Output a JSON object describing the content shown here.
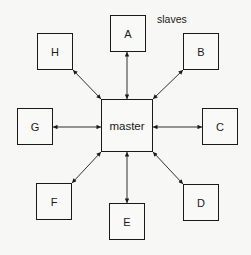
{
  "diagram": {
    "caption": "slaves",
    "master": {
      "label": "master",
      "x": 101,
      "y": 99,
      "w": 52,
      "h": 53
    },
    "slaves": [
      {
        "id": "A",
        "label": "A",
        "x": 110,
        "y": 15,
        "w": 36,
        "h": 37
      },
      {
        "id": "B",
        "label": "B",
        "x": 183,
        "y": 33,
        "w": 36,
        "h": 37
      },
      {
        "id": "C",
        "label": "C",
        "x": 202,
        "y": 108,
        "w": 36,
        "h": 37
      },
      {
        "id": "D",
        "label": "D",
        "x": 183,
        "y": 184,
        "w": 36,
        "h": 37
      },
      {
        "id": "E",
        "label": "E",
        "x": 109,
        "y": 203,
        "w": 36,
        "h": 37
      },
      {
        "id": "F",
        "label": "F",
        "x": 36,
        "y": 183,
        "w": 36,
        "h": 37
      },
      {
        "id": "G",
        "label": "G",
        "x": 17,
        "y": 108,
        "w": 36,
        "h": 37
      },
      {
        "id": "H",
        "label": "H",
        "x": 37,
        "y": 33,
        "w": 36,
        "h": 37
      }
    ],
    "connections": [
      {
        "from": "master",
        "to": "A",
        "type": "bidirectional"
      },
      {
        "from": "master",
        "to": "B",
        "type": "bidirectional"
      },
      {
        "from": "master",
        "to": "C",
        "type": "bidirectional"
      },
      {
        "from": "master",
        "to": "D",
        "type": "bidirectional"
      },
      {
        "from": "master",
        "to": "E",
        "type": "bidirectional"
      },
      {
        "from": "master",
        "to": "F",
        "type": "bidirectional"
      },
      {
        "from": "master",
        "to": "G",
        "type": "bidirectional"
      },
      {
        "from": "master",
        "to": "H",
        "type": "bidirectional"
      }
    ]
  }
}
